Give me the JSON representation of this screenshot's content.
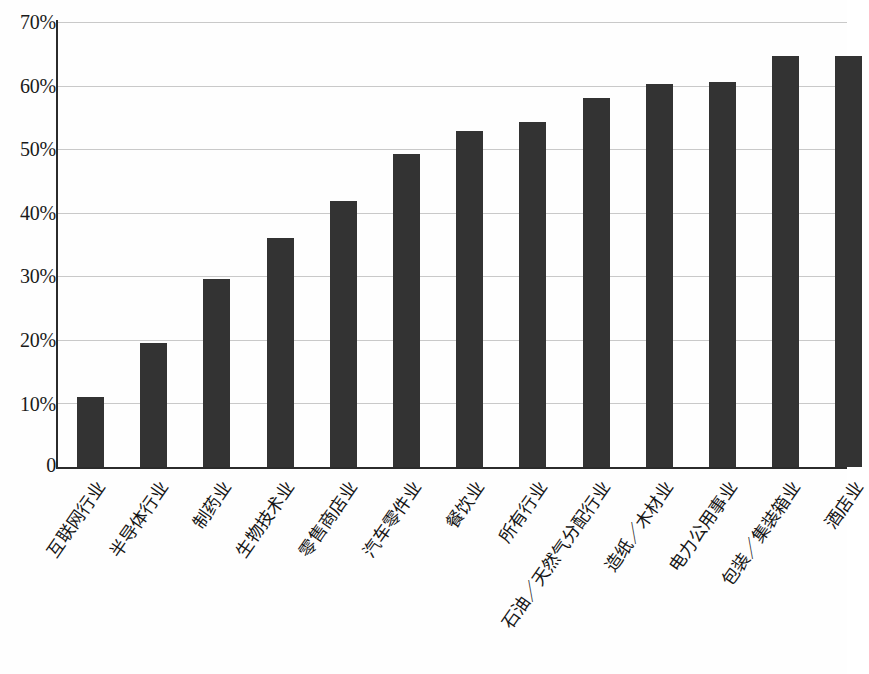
{
  "chart_data": {
    "type": "bar",
    "title": "",
    "subtitle": "",
    "xlabel": "",
    "ylabel": "",
    "ylim": [
      0,
      70
    ],
    "y_unit": "%",
    "grid": true,
    "legend": "none",
    "orientation": "vertical",
    "bar_color": "#333333",
    "gridline_color": "#c9c9c9",
    "axis_color": "#2b2b2b",
    "background_color": "#fefefe",
    "y_ticks": [
      "0",
      "10%",
      "20%",
      "30%",
      "40%",
      "50%",
      "60%",
      "70%"
    ],
    "y_tick_values": [
      0,
      10,
      20,
      30,
      40,
      50,
      60,
      70
    ],
    "categories": [
      "互联网行业",
      "半导体行业",
      "制药业",
      "生物技术业",
      "零售商店业",
      "汽车零件业",
      "餐饮业",
      "所有行业",
      "石油／天然气分配行业",
      "造纸／木材业",
      "电力公用事业",
      "包装／集装箱业",
      "酒店业"
    ],
    "values": [
      11.0,
      19.5,
      29.5,
      36.0,
      41.8,
      49.2,
      52.8,
      54.2,
      58.0,
      60.2,
      60.5,
      64.7,
      64.7
    ],
    "value_labels": [
      "11%",
      "19.5%",
      "29.5%",
      "36%",
      "41.8%",
      "49.2%",
      "52.8%",
      "54.2%",
      "58%",
      "60.2%",
      "60.5%",
      "64.7%",
      "64.7%"
    ]
  }
}
